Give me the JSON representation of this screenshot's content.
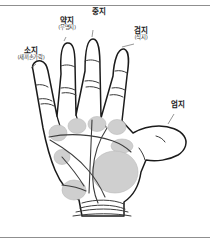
{
  "figure": {
    "title_alt": "palm-finger-name-diagram",
    "border_color": "#8f8f8f",
    "outline_color": "#1b1b1b",
    "pad_fill": "#cfcfcf",
    "pad_stroke": "#b4b4b4",
    "crease_color": "#555555"
  },
  "labels": {
    "little": {
      "main": "소지",
      "sub": "(새끼손가락)"
    },
    "ring": {
      "main": "약지",
      "sub": "(무명지)"
    },
    "middle": {
      "main": "중지",
      "sub": ""
    },
    "index": {
      "main": "검지",
      "sub": "(식지)"
    },
    "thumb": {
      "main": "엄지",
      "sub": ""
    }
  }
}
